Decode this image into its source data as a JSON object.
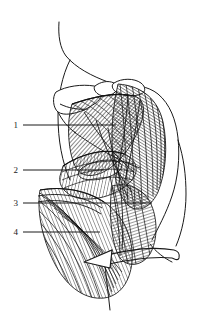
{
  "figure": {
    "background_color": "#ffffff",
    "ink_color": "#1a1a1a",
    "fiber_color": "#2b2b2b",
    "width": 207,
    "height": 318
  },
  "labels": [
    {
      "id": "1",
      "text": "1",
      "x": 14,
      "y": 121,
      "leader_x1": 23,
      "leader_y1": 125,
      "leader_x2": 116,
      "leader_y2": 125
    },
    {
      "id": "2",
      "text": "2",
      "x": 14,
      "y": 166,
      "leader_x1": 23,
      "leader_y1": 170,
      "leader_x2": 104,
      "leader_y2": 170
    },
    {
      "id": "3",
      "text": "3",
      "x": 14,
      "y": 199,
      "leader_x1": 23,
      "leader_y1": 203,
      "leader_x2": 152,
      "leader_y2": 203
    },
    {
      "id": "4",
      "text": "4",
      "x": 14,
      "y": 228,
      "leader_x1": 23,
      "leader_y1": 232,
      "leader_x2": 100,
      "leader_y2": 232
    }
  ],
  "annotations": {
    "motion_arrow": "curved-arrow-pointing-left"
  }
}
